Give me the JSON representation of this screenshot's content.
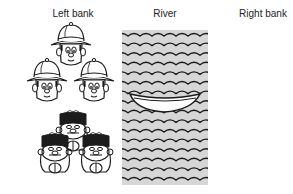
{
  "labels": {
    "left_bank": "Left bank",
    "river": "River",
    "right_bank": "Right bank"
  },
  "scene": {
    "left_bank_missionaries": 3,
    "left_bank_cannibals": 3,
    "boat_side": "left",
    "boat_occupants": 0,
    "right_bank_missionaries": 0,
    "right_bank_cannibals": 0
  },
  "icons": {
    "missionary": "explorer-pith-helmet-icon",
    "cannibal": "cannibal-icon",
    "boat": "boat-icon",
    "water": "wave-pattern"
  },
  "colors": {
    "water": "#d6d6d6",
    "ink": "#1a1a1a",
    "cannibal_hair": "#1c1c1c"
  }
}
